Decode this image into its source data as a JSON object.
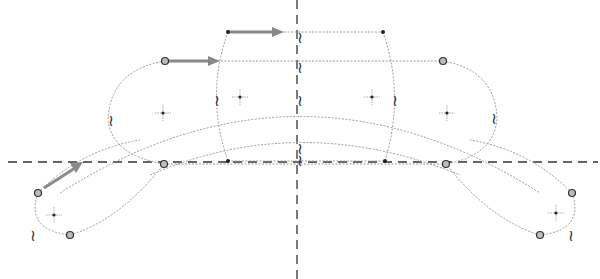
{
  "diagram": {
    "type": "cad-sketch",
    "centerlines": {
      "horizontal_y": 162,
      "vertical_x": 297
    },
    "colors": {
      "geometry": "#9a9a9a",
      "centerline": "#333333",
      "drag_arrow": "#8a8a8a",
      "point": "#222222"
    },
    "symmetry_marker_glyph": "≀",
    "symmetry_markers": [
      {
        "x": 303,
        "y": 38
      },
      {
        "x": 303,
        "y": 68
      },
      {
        "x": 303,
        "y": 101
      },
      {
        "x": 303,
        "y": 128
      },
      {
        "x": 303,
        "y": 161
      },
      {
        "x": 114,
        "y": 120
      },
      {
        "x": 220,
        "y": 100
      },
      {
        "x": 395,
        "y": 100
      },
      {
        "x": 495,
        "y": 118
      },
      {
        "x": 38,
        "y": 236
      },
      {
        "x": 572,
        "y": 236
      }
    ],
    "arc_centers": [
      {
        "x": 163,
        "y": 113
      },
      {
        "x": 240,
        "y": 97
      },
      {
        "x": 372,
        "y": 97
      },
      {
        "x": 447,
        "y": 113
      },
      {
        "x": 54,
        "y": 215
      },
      {
        "x": 556,
        "y": 213
      }
    ],
    "endpoints": [
      {
        "x": 165,
        "y": 61,
        "style": "ring"
      },
      {
        "x": 443,
        "y": 61,
        "style": "ring"
      },
      {
        "x": 164,
        "y": 164,
        "style": "ring"
      },
      {
        "x": 446,
        "y": 164,
        "style": "ring"
      },
      {
        "x": 38,
        "y": 193,
        "style": "ring"
      },
      {
        "x": 70,
        "y": 235,
        "style": "ring"
      },
      {
        "x": 572,
        "y": 193,
        "style": "ring"
      },
      {
        "x": 540,
        "y": 235,
        "style": "ring"
      },
      {
        "x": 228,
        "y": 32,
        "style": "dot"
      },
      {
        "x": 383,
        "y": 32,
        "style": "dot"
      },
      {
        "x": 228,
        "y": 161,
        "style": "dot"
      },
      {
        "x": 385,
        "y": 161,
        "style": "dot"
      }
    ],
    "drag_arrows": [
      {
        "from": [
          228,
          32
        ],
        "to": [
          283,
          32
        ]
      },
      {
        "from": [
          165,
          61
        ],
        "to": [
          220,
          61
        ]
      },
      {
        "from": [
          44,
          188
        ],
        "to": [
          82,
          163
        ]
      }
    ]
  }
}
